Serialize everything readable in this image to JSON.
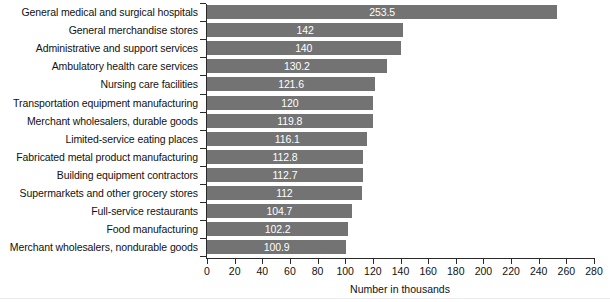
{
  "chart_data": {
    "type": "bar",
    "orientation": "horizontal",
    "title": "",
    "subtitle": "",
    "xlabel": "Number in thousands",
    "ylabel": "",
    "xlim": [
      0,
      280
    ],
    "xticks": [
      0,
      20,
      40,
      60,
      80,
      100,
      120,
      140,
      160,
      180,
      200,
      220,
      240,
      260,
      280
    ],
    "grid": false,
    "legend": null,
    "bar_color": "#737373",
    "value_label_color": "#ffffff",
    "categories": [
      "General medical and surgical hospitals",
      "General merchandise stores",
      "Administrative and support services",
      "Ambulatory health care services",
      "Nursing care facilities",
      "Transportation equipment manufacturing",
      "Merchant wholesalers, durable goods",
      "Limited-service eating places",
      "Fabricated metal product manufacturing",
      "Building equipment contractors",
      "Supermarkets and other grocery stores",
      "Full-service restaurants",
      "Food manufacturing",
      "Merchant wholesalers, nondurable goods"
    ],
    "values": [
      253.5,
      142,
      140,
      130.2,
      121.6,
      120,
      119.8,
      116.1,
      112.8,
      112.7,
      112,
      104.7,
      102.2,
      100.9
    ],
    "value_labels": [
      "253.5",
      "142",
      "140",
      "130.2",
      "121.6",
      "120",
      "119.8",
      "116.1",
      "112.8",
      "112.7",
      "112",
      "104.7",
      "102.2",
      "100.9"
    ]
  },
  "axis": {
    "x_title": "Number in thousands",
    "tick_labels": [
      "0",
      "20",
      "40",
      "60",
      "80",
      "100",
      "120",
      "140",
      "160",
      "180",
      "200",
      "220",
      "240",
      "260",
      "280"
    ]
  }
}
